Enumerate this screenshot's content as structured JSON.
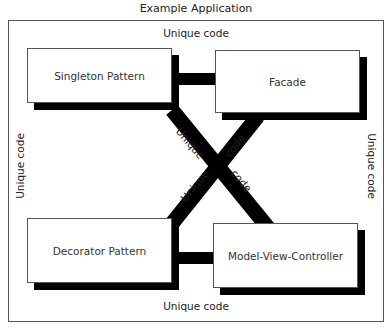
{
  "title": "Example Application",
  "frame_labels": {
    "top": "Unique code",
    "bottom": "Unique code",
    "left": "Unique code",
    "right": "Unique code"
  },
  "boxes": [
    {
      "id": "singleton",
      "label": "Singleton Pattern"
    },
    {
      "id": "facade",
      "label": "Facade"
    },
    {
      "id": "decorator",
      "label": "Decorator Pattern"
    },
    {
      "id": "mvc",
      "label": "Model-View-Controller"
    }
  ],
  "diagonal_labels": {
    "upper_left": "Unique",
    "upper_right": "code",
    "lower_left": "Unique",
    "lower_right": "code"
  },
  "colors": {
    "connector": "#000000",
    "box_border": "#555555",
    "frame_border": "#555555",
    "background": "#ffffff"
  }
}
